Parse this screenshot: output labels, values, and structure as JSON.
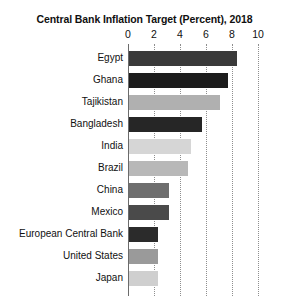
{
  "chart_data": {
    "type": "bar",
    "orientation": "horizontal",
    "title": "Central Bank Inflation Target (Percent), 2018",
    "xlabel": "",
    "ylabel": "",
    "xlim": [
      0,
      10
    ],
    "xticks": [
      0,
      2,
      4,
      6,
      8,
      10
    ],
    "xtick_labels": [
      "0",
      "2",
      "4",
      "6",
      "8",
      "10"
    ],
    "grid": true,
    "grid_axis": "x",
    "legend": false,
    "categories": [
      "Egypt",
      "Ghana",
      "Tajikistan",
      "Bangladesh",
      "India",
      "Brazil",
      "China",
      "Mexico",
      "European Central Bank",
      "United States",
      "Japan"
    ],
    "values": [
      8.3,
      7.6,
      7.0,
      5.6,
      4.8,
      4.5,
      3.1,
      3.1,
      2.2,
      2.2,
      2.2
    ],
    "bar_colors": [
      "#3a3a3a",
      "#1c1c1c",
      "#b0b0b0",
      "#262626",
      "#d6d6d6",
      "#b8b8b8",
      "#6e6e6e",
      "#4a4a4a",
      "#2b2b2b",
      "#9a9a9a",
      "#cfcfcf"
    ]
  },
  "style": {
    "background": "#ffffff",
    "axis_color": "#6b6b6b",
    "grid_color": "#8e8e8e",
    "text_color": "#101010"
  }
}
